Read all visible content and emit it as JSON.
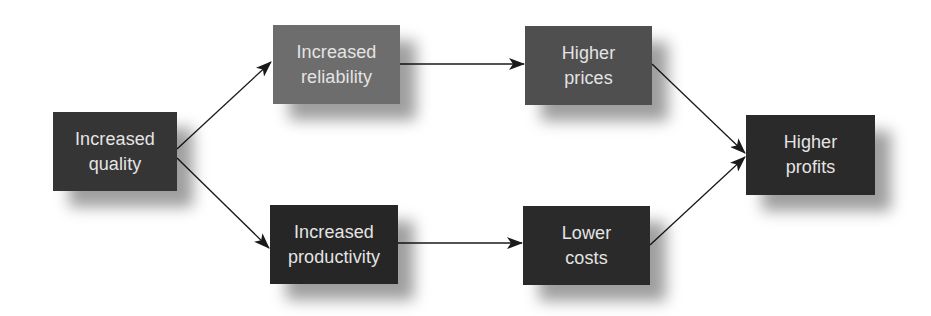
{
  "diagram": {
    "type": "flowchart",
    "nodes": [
      {
        "id": "quality",
        "line1": "Increased",
        "line2": "quality",
        "color": "#353535",
        "x": 53,
        "y": 112,
        "w": 124,
        "h": 79
      },
      {
        "id": "reliability",
        "line1": "Increased",
        "line2": "reliability",
        "color": "#6d6d6d",
        "x": 273,
        "y": 25,
        "w": 127,
        "h": 79
      },
      {
        "id": "productivity",
        "line1": "Increased",
        "line2": "productivity",
        "color": "#262626",
        "x": 270,
        "y": 205,
        "w": 128,
        "h": 79
      },
      {
        "id": "prices",
        "line1": "Higher",
        "line2": "prices",
        "color": "#4f4f4f",
        "x": 525,
        "y": 26,
        "w": 127,
        "h": 79
      },
      {
        "id": "costs",
        "line1": "Lower",
        "line2": "costs",
        "color": "#2a2a2a",
        "x": 523,
        "y": 206,
        "w": 127,
        "h": 79
      },
      {
        "id": "profits",
        "line1": "Higher",
        "line2": "profits",
        "color": "#2a2a2a",
        "x": 746,
        "y": 115,
        "w": 129,
        "h": 80
      }
    ],
    "edges": [
      {
        "from": "quality",
        "to": "reliability"
      },
      {
        "from": "quality",
        "to": "productivity"
      },
      {
        "from": "reliability",
        "to": "prices"
      },
      {
        "from": "productivity",
        "to": "costs"
      },
      {
        "from": "prices",
        "to": "profits"
      },
      {
        "from": "costs",
        "to": "profits"
      }
    ],
    "arrow_color": "#1a1a1a"
  }
}
